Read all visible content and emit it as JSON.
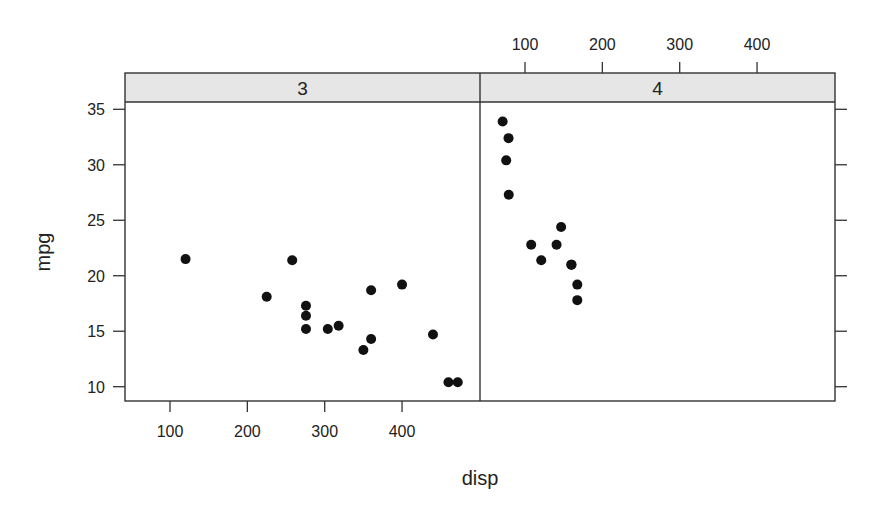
{
  "chart_data": {
    "type": "scatter",
    "title": "",
    "xlabel": "disp",
    "ylabel": "mpg",
    "layout": "lattice trellis, 2 panels side by side, conditioned on gear",
    "xlim": [
      45,
      495
    ],
    "ylim": [
      8.8,
      35.5
    ],
    "x_ticks": [
      100,
      200,
      300,
      400
    ],
    "y_ticks": [
      10,
      15,
      20,
      25,
      30,
      35
    ],
    "grid": false,
    "legend": null,
    "panels": [
      {
        "strip_label": "3",
        "x_tick_side": "bottom",
        "y_tick_side": "left",
        "points": [
          {
            "x": 120.1,
            "y": 21.5
          },
          {
            "x": 258,
            "y": 21.4
          },
          {
            "x": 225,
            "y": 18.1
          },
          {
            "x": 275.8,
            "y": 17.3
          },
          {
            "x": 275.8,
            "y": 16.4
          },
          {
            "x": 275.8,
            "y": 15.2
          },
          {
            "x": 304,
            "y": 15.2
          },
          {
            "x": 318,
            "y": 15.5
          },
          {
            "x": 360,
            "y": 18.7
          },
          {
            "x": 400,
            "y": 19.2
          },
          {
            "x": 360,
            "y": 14.3
          },
          {
            "x": 350,
            "y": 13.3
          },
          {
            "x": 440,
            "y": 14.7
          },
          {
            "x": 460,
            "y": 10.4
          },
          {
            "x": 472,
            "y": 10.4
          }
        ]
      },
      {
        "strip_label": "4",
        "x_tick_side": "top",
        "y_tick_side": "right",
        "points": [
          {
            "x": 71.1,
            "y": 33.9
          },
          {
            "x": 78.7,
            "y": 32.4
          },
          {
            "x": 75.7,
            "y": 30.4
          },
          {
            "x": 79,
            "y": 27.3
          },
          {
            "x": 146.7,
            "y": 24.4
          },
          {
            "x": 108,
            "y": 22.8
          },
          {
            "x": 140.8,
            "y": 22.8
          },
          {
            "x": 121,
            "y": 21.4
          },
          {
            "x": 160,
            "y": 21.0
          },
          {
            "x": 160,
            "y": 21.0
          },
          {
            "x": 167.6,
            "y": 19.2
          },
          {
            "x": 167.6,
            "y": 17.8
          }
        ]
      }
    ]
  },
  "style": {
    "strip_fill": "#e6e6e6",
    "frame_color": "#333333",
    "point_color": "#111111",
    "text_color": "#222222"
  },
  "labels": {
    "xlabel": "disp",
    "ylabel": "mpg"
  }
}
